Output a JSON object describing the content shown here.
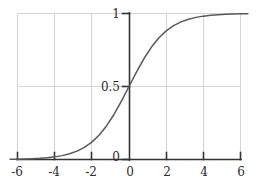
{
  "chart_data": {
    "type": "line",
    "title": "",
    "subtitle": "",
    "xlabel": "",
    "ylabel": "",
    "xlim": [
      -6.4,
      6.4
    ],
    "ylim": [
      -0.06,
      1.06
    ],
    "grid": true,
    "legend": null,
    "function": "sigmoid: y = 1 / (1 + e^(-x))",
    "xticks": [
      -6,
      -4,
      -2,
      0,
      2,
      4,
      6
    ],
    "xtick_labels": [
      "-6",
      "-4",
      "-2",
      "0",
      "2",
      "4",
      "6"
    ],
    "yticks": [
      0,
      0.5,
      1
    ],
    "ytick_labels": [
      "0",
      "0.5",
      "1"
    ],
    "series": [
      {
        "name": "sigmoid",
        "color": "#595959",
        "x": [
          -6.4,
          -6.0,
          -5.6,
          -5.2,
          -4.8,
          -4.4,
          -4.0,
          -3.6,
          -3.2,
          -2.8,
          -2.4,
          -2.0,
          -1.6,
          -1.2,
          -0.8,
          -0.4,
          0.0,
          0.4,
          0.8,
          1.2,
          1.6,
          2.0,
          2.4,
          2.8,
          3.2,
          3.6,
          4.0,
          4.4,
          4.8,
          5.2,
          5.6,
          6.0,
          6.4
        ],
        "y": [
          0.0017,
          0.0025,
          0.0037,
          0.0055,
          0.0082,
          0.0121,
          0.018,
          0.0266,
          0.0392,
          0.0573,
          0.0832,
          0.1192,
          0.168,
          0.2315,
          0.31,
          0.4013,
          0.5,
          0.5987,
          0.69,
          0.7685,
          0.832,
          0.8808,
          0.9168,
          0.9427,
          0.9608,
          0.9734,
          0.982,
          0.9879,
          0.9918,
          0.9945,
          0.9963,
          0.9975,
          0.9983
        ]
      }
    ]
  },
  "axes": {
    "x_axis_name": "x-axis",
    "y_axis_name": "y-axis",
    "axis_color": "#333333",
    "grid_color": "#d5d5d5",
    "background": "#ffffff"
  }
}
